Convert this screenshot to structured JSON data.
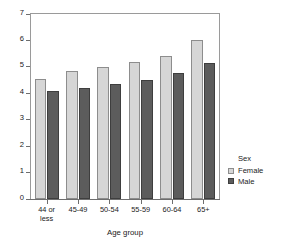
{
  "chart_data": {
    "type": "bar",
    "title": "",
    "xlabel": "Age group",
    "ylabel": "Mean completion time in hours",
    "categories": [
      "44 or\nless",
      "45-49",
      "50-54",
      "55-59",
      "60-64",
      "65+"
    ],
    "series": [
      {
        "name": "Female",
        "color": "#d6d6d6",
        "values": [
          4.55,
          4.85,
          5.0,
          5.2,
          5.4,
          6.0
        ]
      },
      {
        "name": "Male",
        "color": "#5c5c5c",
        "values": [
          4.1,
          4.2,
          4.35,
          4.5,
          4.75,
          5.15
        ]
      }
    ],
    "ylim": [
      0,
      7
    ],
    "yticks": [
      0,
      1,
      2,
      3,
      4,
      5,
      6,
      7
    ],
    "ytick_labels": [
      "0",
      "1",
      "2",
      "3",
      "4",
      "5",
      "6",
      "7"
    ],
    "grid": false,
    "legend": {
      "title": "Sex",
      "position": "right",
      "entries": [
        "Female",
        "Male"
      ]
    }
  }
}
